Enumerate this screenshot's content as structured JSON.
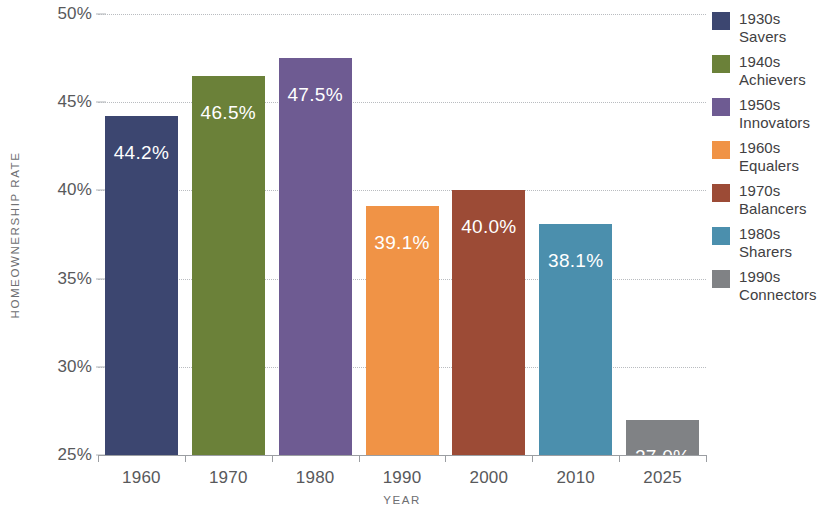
{
  "chart_data": {
    "type": "bar",
    "title": "",
    "xlabel": "YEAR",
    "ylabel": "HOMEOWNERSHIP RATE",
    "categories": [
      "1960",
      "1970",
      "1980",
      "1990",
      "2000",
      "2010",
      "2025"
    ],
    "values": [
      44.2,
      46.5,
      47.5,
      39.1,
      40.0,
      38.1,
      27.0
    ],
    "value_labels": [
      "44.2%",
      "46.5%",
      "47.5%",
      "39.1%",
      "40.0%",
      "38.1%",
      "27.0%"
    ],
    "ylim": [
      25,
      50
    ],
    "ytick_values": [
      25,
      30,
      35,
      40,
      45,
      50
    ],
    "ytick_labels": [
      "25%",
      "30%",
      "35%",
      "40%",
      "45%",
      "50%"
    ],
    "grid": true,
    "legend_position": "right",
    "series": [
      {
        "name": "1930s Savers",
        "decade": "1930s",
        "cohort": "Savers",
        "category": "1960",
        "value": 44.2,
        "color": "#3c4670"
      },
      {
        "name": "1940s Achievers",
        "decade": "1940s",
        "cohort": "Achievers",
        "category": "1970",
        "value": 46.5,
        "color": "#6b8139"
      },
      {
        "name": "1950s Innovators",
        "decade": "1950s",
        "cohort": "Innovators",
        "category": "1980",
        "value": 47.5,
        "color": "#6e5b92"
      },
      {
        "name": "1960s Equalers",
        "decade": "1960s",
        "cohort": "Equalers",
        "category": "1990",
        "value": 39.1,
        "color": "#f09346"
      },
      {
        "name": "1970s Balancers",
        "decade": "1970s",
        "cohort": "Balancers",
        "category": "2000",
        "value": 40.0,
        "color": "#9c4b36"
      },
      {
        "name": "1980s Sharers",
        "decade": "1980s",
        "cohort": "Sharers",
        "category": "2010",
        "value": 38.1,
        "color": "#4b8fad"
      },
      {
        "name": "1990s Connectors",
        "decade": "1990s",
        "cohort": "Connectors",
        "category": "2025",
        "value": 27.0,
        "color": "#808285"
      }
    ]
  },
  "legend": {
    "items": [
      {
        "decade": "1930s",
        "cohort": "Savers",
        "color": "#3c4670"
      },
      {
        "decade": "1940s",
        "cohort": "Achievers",
        "color": "#6b8139"
      },
      {
        "decade": "1950s",
        "cohort": "Innovators",
        "color": "#6e5b92"
      },
      {
        "decade": "1960s",
        "cohort": "Equalers",
        "color": "#f09346"
      },
      {
        "decade": "1970s",
        "cohort": "Balancers",
        "color": "#9c4b36"
      },
      {
        "decade": "1980s",
        "cohort": "Sharers",
        "color": "#4b8fad"
      },
      {
        "decade": "1990s",
        "cohort": "Connectors",
        "color": "#808285"
      }
    ]
  },
  "axes": {
    "y_title": "HOMEOWNERSHIP RATE",
    "x_title": "YEAR"
  }
}
